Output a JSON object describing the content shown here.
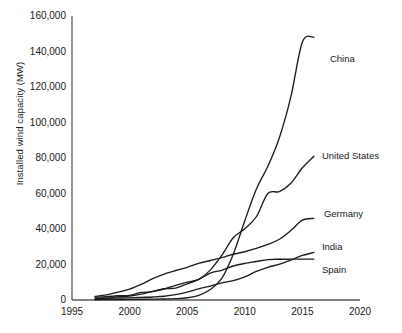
{
  "chart_data": {
    "type": "line",
    "title": "",
    "xlabel": "",
    "ylabel": "Installed wind capacity (MW)",
    "xlim": [
      1995,
      2020
    ],
    "ylim": [
      0,
      160000
    ],
    "grid": false,
    "legend_position": "inline-right-end-labels",
    "xticks": [
      "1995",
      "2000",
      "2005",
      "2010",
      "2015",
      "2020"
    ],
    "xtick_values": [
      1995,
      2000,
      2005,
      2010,
      2015,
      2020
    ],
    "yticks": [
      "0",
      "20,000",
      "40,000",
      "60,000",
      "80,000",
      "100,000",
      "120,000",
      "140,000",
      "160,000"
    ],
    "ytick_values": [
      0,
      20000,
      40000,
      60000,
      80000,
      100000,
      120000,
      140000,
      160000
    ],
    "x": [
      1997,
      1998,
      1999,
      2000,
      2001,
      2002,
      2003,
      2004,
      2005,
      2006,
      2007,
      2008,
      2009,
      2010,
      2011,
      2012,
      2013,
      2014,
      2015,
      2016
    ],
    "series": [
      {
        "name": "China",
        "label": "China",
        "values": [
          170,
          220,
          260,
          340,
          400,
          470,
          570,
          760,
          1270,
          2600,
          5900,
          12200,
          25800,
          44700,
          62400,
          75300,
          91400,
          114600,
          145400,
          148000
        ]
      },
      {
        "name": "United States",
        "label": "United States",
        "values": [
          1610,
          1820,
          2470,
          2580,
          4260,
          4680,
          6350,
          6720,
          9150,
          11600,
          16820,
          25170,
          35060,
          40180,
          46900,
          60000,
          61100,
          65800,
          74500,
          81000
        ]
      },
      {
        "name": "Germany",
        "label": "Germany",
        "values": [
          2080,
          2880,
          4440,
          6100,
          8750,
          11990,
          14600,
          16630,
          18420,
          20620,
          22250,
          23900,
          25780,
          27190,
          29060,
          31300,
          34250,
          39170,
          44950,
          46000
        ]
      },
      {
        "name": "India",
        "label": "India",
        "values": [
          940,
          1010,
          1090,
          1220,
          1450,
          1700,
          2120,
          3000,
          4430,
          6270,
          7850,
          9650,
          10930,
          13060,
          16080,
          18420,
          20150,
          22470,
          25090,
          26800
        ]
      },
      {
        "name": "Spain",
        "label": "Spain",
        "values": [
          500,
          880,
          1810,
          2240,
          3340,
          4830,
          6200,
          8260,
          10030,
          11630,
          15130,
          16740,
          19150,
          20620,
          21670,
          22780,
          22950,
          22990,
          23020,
          23050
        ]
      }
    ]
  }
}
